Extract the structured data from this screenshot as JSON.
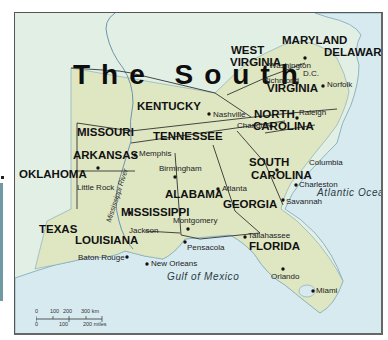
{
  "map": {
    "title": "The South",
    "colors": {
      "region_land": "#dfe6c2",
      "other_land": "#e2efe4",
      "water": "#d7eaf0",
      "state_border": "#333333",
      "coastline": "#7aa4b8",
      "river": "#6c95b0",
      "frame": "#555555"
    },
    "states": [
      {
        "name": "WEST",
        "x": 230,
        "y": 40
      },
      {
        "name": "VIRGINIA",
        "x": 229,
        "y": 52
      },
      {
        "name": "MARYLAND",
        "x": 281,
        "y": 30
      },
      {
        "name": "DELAWARE",
        "x": 323,
        "y": 42
      },
      {
        "name": "VIRGINIA",
        "x": 266,
        "y": 78
      },
      {
        "name": "KENTUCKY",
        "x": 136,
        "y": 96
      },
      {
        "name": "NORTH",
        "x": 253,
        "y": 96
      },
      {
        "name": "CAROLINA",
        "x": 252,
        "y": 109
      },
      {
        "name": "MISSOURI",
        "x": 62,
        "y": 112
      },
      {
        "name": "TENNESSEE",
        "x": 138,
        "y": 116
      },
      {
        "name": "ARKANSAS",
        "x": 57,
        "y": 131
      },
      {
        "name": "OKLAHOMA",
        "x": 6,
        "y": 149
      },
      {
        "name": "SOUTH",
        "x": 248,
        "y": 145
      },
      {
        "name": "CAROLINA",
        "x": 250,
        "y": 158
      },
      {
        "name": "ALABAMA",
        "x": 150,
        "y": 172
      },
      {
        "name": "GEORGIA",
        "x": 221,
        "y": 187
      },
      {
        "name": "MISSISSIPPI",
        "x": 108,
        "y": 192
      },
      {
        "name": "TEXAS",
        "x": 24,
        "y": 210
      },
      {
        "name": "LOUISIANA",
        "x": 60,
        "y": 226
      },
      {
        "name": "FLORIDA",
        "x": 248,
        "y": 234
      }
    ],
    "cities": [
      {
        "name": "Washington",
        "x": 266,
        "y": 48,
        "dot_x": 304,
        "dot_y": 44
      },
      {
        "name": "D.C.",
        "x": 302,
        "y": 58
      },
      {
        "name": "Richmond",
        "x": 256,
        "y": 63,
        "dot_x": 296,
        "dot_y": 70
      },
      {
        "name": "Norfolk",
        "x": 327,
        "y": 68,
        "dot_x": 322,
        "dot_y": 73
      },
      {
        "name": "Raleigh",
        "x": 296,
        "y": 94,
        "dot_x": 296,
        "dot_y": 106
      },
      {
        "name": "Nashville",
        "x": 213,
        "y": 98,
        "dot_x": 208,
        "dot_y": 101
      },
      {
        "name": "Charlotte",
        "x": 237,
        "y": 110,
        "dot_x": 270,
        "dot_y": 114
      },
      {
        "name": "Memphis",
        "x": 123,
        "y": 138,
        "dot_x": 120,
        "dot_y": 143
      },
      {
        "name": "Birmingham",
        "x": 160,
        "y": 152,
        "dot_x": 174,
        "dot_y": 163
      },
      {
        "name": "Columbia",
        "x": 299,
        "y": 146,
        "dot_x": 276,
        "dot_y": 157
      },
      {
        "name": "Atlanta",
        "x": 219,
        "y": 171,
        "dot_x": 217,
        "dot_y": 176
      },
      {
        "name": "Little Rock",
        "x": 65,
        "y": 168,
        "dot_x": 82,
        "dot_y": 161
      },
      {
        "name": "Charleston",
        "x": 288,
        "y": 170,
        "dot_x": 285,
        "dot_y": 174
      },
      {
        "name": "Savannah",
        "x": 275,
        "y": 186,
        "dot_x": 273,
        "dot_y": 188
      },
      {
        "name": "Jackson",
        "x": 129,
        "y": 214,
        "dot_x": 128,
        "dot_y": 210
      },
      {
        "name": "Montgomery",
        "x": 173,
        "y": 207,
        "dot_x": 187,
        "dot_y": 217
      },
      {
        "name": "Tallahassee",
        "x": 245,
        "y": 221,
        "dot_x": 242,
        "dot_y": 225
      },
      {
        "name": "Pensacola",
        "x": 187,
        "y": 230,
        "dot_x": 184,
        "dot_y": 230
      },
      {
        "name": "Baton Rouge",
        "x": 76,
        "y": 241,
        "dot_x": 122,
        "dot_y": 245
      },
      {
        "name": "New Orleans",
        "x": 150,
        "y": 248,
        "dot_x": 146,
        "dot_y": 252
      },
      {
        "name": "Orlando",
        "x": 267,
        "y": 262,
        "dot_x": 282,
        "dot_y": 256
      },
      {
        "name": "Miami",
        "x": 316,
        "y": 287,
        "dot_x": 313,
        "dot_y": 290
      }
    ],
    "water_bodies": [
      {
        "name": "Atlantic Ocean",
        "x": 305,
        "y": 180
      },
      {
        "name": "Gulf of Mexico",
        "x": 164,
        "y": 272
      }
    ],
    "river_label": {
      "name": "Mississippi River",
      "x": 103,
      "y": 210,
      "angle": -72
    },
    "scale_bar": {
      "km_labels": [
        "0",
        "100",
        "200",
        "300 km"
      ],
      "mile_labels": [
        "0",
        "100",
        "200 miles"
      ]
    }
  }
}
